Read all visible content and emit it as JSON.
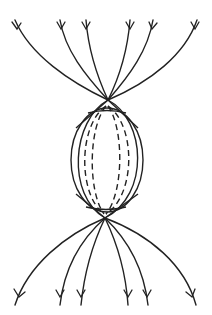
{
  "figure": {
    "colors": {
      "line": "#222222",
      "background": "#ffffff"
    },
    "top_apex": [
      108,
      100
    ],
    "bottom_apex": [
      105,
      218
    ],
    "sphere": {
      "cx": 107,
      "cy": 160,
      "rx": 36,
      "ry": 52
    },
    "top_lines_end_x": [
      15,
      60,
      86,
      130,
      153,
      197
    ],
    "bottom_lines_end_x": [
      15,
      60,
      81,
      128,
      148,
      196
    ],
    "arrow_direction": "downward"
  }
}
